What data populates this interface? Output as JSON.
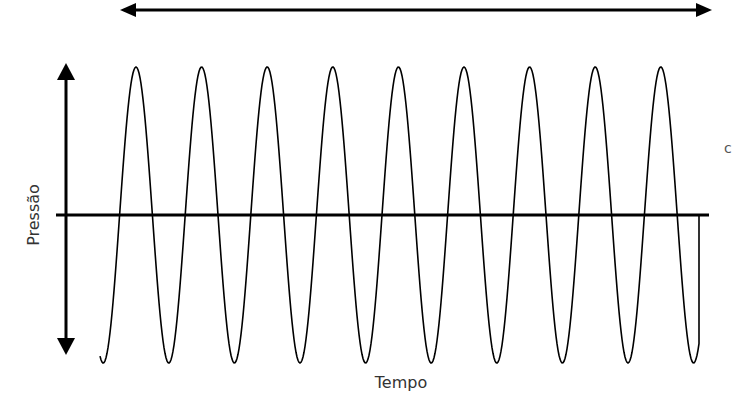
{
  "diagram": {
    "type": "sound-wave-pressure-time",
    "y_axis_label": "Pressão",
    "x_axis_label": "Tempo",
    "edge_clipped_text": "c",
    "colors": {
      "stroke": "#000000",
      "text": "#333333",
      "background": "#ffffff"
    },
    "wavelength_arrow": {
      "x1": 120,
      "x2": 712,
      "y": 10
    },
    "pressure_arrow": {
      "x": 66,
      "y1": 63,
      "y2": 355
    },
    "time_axis": {
      "x1": 56,
      "x2": 709,
      "y": 215
    },
    "wave": {
      "start_x": 100,
      "end_x": 699,
      "midline_y": 215,
      "amplitude_px": 148,
      "period_px": 65.6,
      "first_peak_x": 136,
      "cycles_visible": 9
    }
  }
}
